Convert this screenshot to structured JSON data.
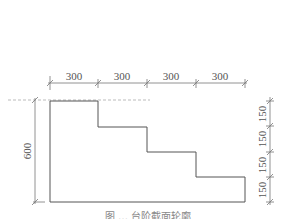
{
  "diagram": {
    "type": "stair-step section with dimensions",
    "top_dimensions": [
      "300",
      "300",
      "300",
      "300"
    ],
    "left_dimension": "600",
    "right_dimensions": [
      "150",
      "150",
      "150",
      "150"
    ],
    "caption": "图 … 台阶截面轮廓",
    "colors": {
      "outline": "#555555",
      "dimension": "#777777",
      "dashed": "#aaaaaa",
      "text": "#555555"
    }
  }
}
